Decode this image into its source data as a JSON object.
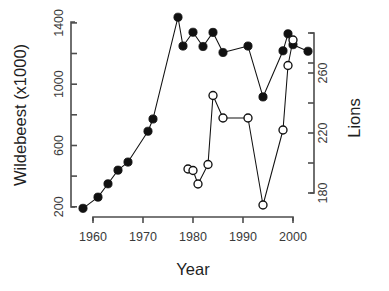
{
  "chart_data": {
    "type": "scatter",
    "title": "",
    "subtitle": "",
    "xlabel": "Year",
    "ylabel": "Wildebeest (x1000)",
    "y2label": "Lions",
    "xlim": [
      1956.5,
      2005.5
    ],
    "ylim": [
      170,
      1460
    ],
    "y2lim": [
      168,
      285
    ],
    "grid": false,
    "legend": "none",
    "xticks": [
      1960,
      1970,
      1980,
      1990,
      2000
    ],
    "xtick_labels": [
      "1960",
      "1970",
      "1980",
      "1990",
      "2000"
    ],
    "yticks": [
      200,
      400,
      600,
      800,
      1000,
      1200,
      1400
    ],
    "ytick_labels": [
      "200",
      "",
      "600",
      "",
      "1000",
      "",
      "1400"
    ],
    "y2ticks": [
      180,
      200,
      220,
      240,
      260,
      280
    ],
    "y2tick_labels": [
      "180",
      "",
      "220",
      "",
      "260",
      ""
    ],
    "series": [
      {
        "name": "Wildebeest",
        "marker": "filled-circle",
        "axis": "left",
        "units": "x1000",
        "points": [
          {
            "x": 1958,
            "y": 190
          },
          {
            "x": 1961,
            "y": 263
          },
          {
            "x": 1963,
            "y": 350
          },
          {
            "x": 1965,
            "y": 439
          },
          {
            "x": 1967,
            "y": 492
          },
          {
            "x": 1971,
            "y": 693
          },
          {
            "x": 1972,
            "y": 773
          },
          {
            "x": 1977,
            "y": 1437
          },
          {
            "x": 1978,
            "y": 1249
          },
          {
            "x": 1980,
            "y": 1339
          },
          {
            "x": 1982,
            "y": 1246
          },
          {
            "x": 1984,
            "y": 1338
          },
          {
            "x": 1986,
            "y": 1207
          },
          {
            "x": 1991,
            "y": 1249
          },
          {
            "x": 1994,
            "y": 917
          },
          {
            "x": 1998,
            "y": 1218
          },
          {
            "x": 1999,
            "y": 1329
          },
          {
            "x": 2000,
            "y": 1258
          },
          {
            "x": 2003,
            "y": 1215
          }
        ]
      },
      {
        "name": "Lions",
        "marker": "open-circle",
        "axis": "right",
        "units": "count",
        "points": [
          {
            "x": 1979,
            "y": 196
          },
          {
            "x": 1980,
            "y": 195
          },
          {
            "x": 1981,
            "y": 186
          },
          {
            "x": 1983,
            "y": 199
          },
          {
            "x": 1984,
            "y": 245
          },
          {
            "x": 1986,
            "y": 230
          },
          {
            "x": 1991,
            "y": 230
          },
          {
            "x": 1994,
            "y": 172
          },
          {
            "x": 1998,
            "y": 222
          },
          {
            "x": 1999,
            "y": 265
          },
          {
            "x": 2000,
            "y": 282
          }
        ]
      }
    ]
  },
  "axes": {
    "left_title": "Wildebeest (x1000)",
    "right_title": "Lions",
    "bottom_title": "Year"
  },
  "labels": {
    "x": [
      "1960",
      "1970",
      "1980",
      "1990",
      "2000"
    ],
    "y_left": [
      "200",
      "600",
      "1000",
      "1400"
    ],
    "y_right": [
      "180",
      "220",
      "260"
    ]
  }
}
